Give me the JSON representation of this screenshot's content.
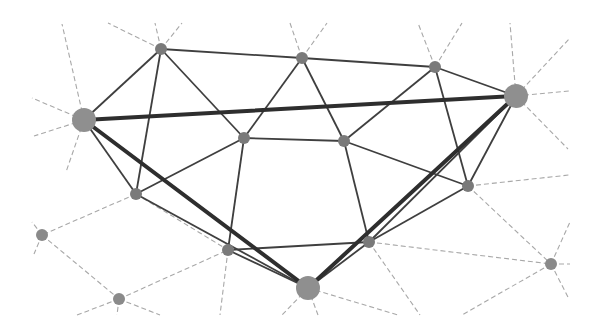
{
  "diagram": {
    "type": "network-graph",
    "colors": {
      "background": "#ffffff",
      "node_fill": "#7a7a7a",
      "big_node_fill": "#8f8f8f",
      "solid_edge": "#3f3f3f",
      "thick_edge": "#2e2e2e",
      "dashed_edge": "#a8a8a8",
      "outer_node_fill": "#8a8a8a"
    },
    "nodes": [
      {
        "id": "A",
        "x": 84,
        "y": 120,
        "r": 12,
        "kind": "big"
      },
      {
        "id": "B",
        "x": 161,
        "y": 49,
        "r": 6,
        "kind": "inner"
      },
      {
        "id": "C",
        "x": 302,
        "y": 58,
        "r": 6,
        "kind": "inner"
      },
      {
        "id": "D",
        "x": 435,
        "y": 67,
        "r": 6,
        "kind": "inner"
      },
      {
        "id": "E",
        "x": 516,
        "y": 96,
        "r": 12,
        "kind": "big"
      },
      {
        "id": "F",
        "x": 244,
        "y": 138,
        "r": 6,
        "kind": "inner"
      },
      {
        "id": "G",
        "x": 344,
        "y": 141,
        "r": 6,
        "kind": "inner"
      },
      {
        "id": "H",
        "x": 136,
        "y": 194,
        "r": 6,
        "kind": "inner"
      },
      {
        "id": "I",
        "x": 468,
        "y": 186,
        "r": 6,
        "kind": "inner"
      },
      {
        "id": "J",
        "x": 228,
        "y": 250,
        "r": 6,
        "kind": "inner"
      },
      {
        "id": "K",
        "x": 369,
        "y": 242,
        "r": 6,
        "kind": "inner"
      },
      {
        "id": "L",
        "x": 308,
        "y": 288,
        "r": 12,
        "kind": "big"
      },
      {
        "id": "M",
        "x": 42,
        "y": 235,
        "r": 6,
        "kind": "outer"
      },
      {
        "id": "N",
        "x": 119,
        "y": 299,
        "r": 6,
        "kind": "outer"
      },
      {
        "id": "O",
        "x": 551,
        "y": 264,
        "r": 6,
        "kind": "outer"
      }
    ],
    "thick_edges": [
      [
        "A",
        "E"
      ],
      [
        "A",
        "L"
      ],
      [
        "E",
        "L"
      ]
    ],
    "solid_edges": [
      [
        "A",
        "B"
      ],
      [
        "B",
        "C"
      ],
      [
        "C",
        "D"
      ],
      [
        "D",
        "E"
      ],
      [
        "B",
        "F"
      ],
      [
        "B",
        "H"
      ],
      [
        "A",
        "H"
      ],
      [
        "C",
        "F"
      ],
      [
        "C",
        "G"
      ],
      [
        "D",
        "G"
      ],
      [
        "D",
        "I"
      ],
      [
        "F",
        "G"
      ],
      [
        "F",
        "H"
      ],
      [
        "F",
        "J"
      ],
      [
        "G",
        "I"
      ],
      [
        "G",
        "K"
      ],
      [
        "H",
        "L"
      ],
      [
        "J",
        "K"
      ],
      [
        "J",
        "L"
      ],
      [
        "K",
        "L"
      ],
      [
        "I",
        "K"
      ],
      [
        "E",
        "I"
      ],
      [
        "E",
        "K"
      ]
    ],
    "dashed_edges": [
      [
        "H",
        "M"
      ],
      [
        "H",
        "J"
      ],
      [
        "M",
        "N"
      ],
      [
        "N",
        "J"
      ],
      [
        "K",
        "O"
      ],
      [
        "I",
        "O"
      ]
    ],
    "dashed_stubs": [
      [
        84,
        120,
        62,
        24
      ],
      [
        84,
        120,
        32,
        98
      ],
      [
        84,
        120,
        34,
        136
      ],
      [
        84,
        120,
        66,
        172
      ],
      [
        161,
        49,
        108,
        23
      ],
      [
        161,
        49,
        155,
        23
      ],
      [
        161,
        49,
        182,
        23
      ],
      [
        302,
        58,
        290,
        23
      ],
      [
        302,
        58,
        327,
        23
      ],
      [
        435,
        67,
        418,
        23
      ],
      [
        435,
        67,
        462,
        23
      ],
      [
        516,
        96,
        510,
        23
      ],
      [
        516,
        96,
        570,
        38
      ],
      [
        516,
        96,
        569,
        91
      ],
      [
        516,
        96,
        568,
        149
      ],
      [
        468,
        186,
        569,
        175
      ],
      [
        42,
        235,
        32,
        222
      ],
      [
        42,
        235,
        34,
        254
      ],
      [
        119,
        299,
        77,
        315
      ],
      [
        119,
        299,
        117,
        315
      ],
      [
        119,
        299,
        160,
        315
      ],
      [
        228,
        250,
        220,
        315
      ],
      [
        308,
        288,
        282,
        315
      ],
      [
        308,
        288,
        318,
        315
      ],
      [
        308,
        288,
        398,
        315
      ],
      [
        369,
        242,
        420,
        315
      ],
      [
        551,
        264,
        570,
        222
      ],
      [
        551,
        264,
        570,
        264
      ],
      [
        551,
        264,
        569,
        299
      ],
      [
        551,
        264,
        462,
        315
      ]
    ]
  }
}
